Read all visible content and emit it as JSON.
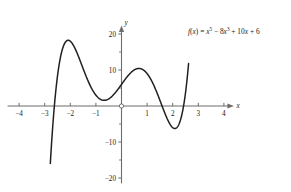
{
  "chart_data": {
    "type": "line",
    "title": "",
    "xlabel": "x",
    "ylabel": "y",
    "equation_text": "f(x) = x⁵ − 8x³ + 10x + 6",
    "equation_parts": {
      "fname": "f",
      "arg_open": "(",
      "arg": "x",
      "arg_close": ")",
      "equals": " = ",
      "term1_base": "x",
      "term1_exp": "5",
      "term2_op": " − ",
      "term2_coef": "8",
      "term2_base": "x",
      "term2_exp": "3",
      "term3_op": " + ",
      "term3_coef": "10",
      "term3_base": "x",
      "term4_op": " + ",
      "term4_const": "6"
    },
    "polynomial_coefficients": [
      6,
      10,
      0,
      -8,
      0,
      1
    ],
    "polynomial_description": "f(x) = 1*x^5 + 0*x^4 + (-8)*x^3 + 0*x^2 + 10*x + 6",
    "xlim": [
      -4.45,
      4.45
    ],
    "ylim": [
      -21.5,
      22.5
    ],
    "x_domain_drawn": [
      -2.78,
      2.62
    ],
    "grid": false,
    "legend_position": "none",
    "x_ticks_labeled": [
      -4,
      -3,
      -2,
      -1,
      1,
      2,
      3,
      4
    ],
    "x_tick_labels": [
      "−4",
      "−3",
      "−2",
      "−1",
      "1",
      "2",
      "3",
      "4"
    ],
    "y_ticks_labeled": [
      20,
      10,
      -10,
      -20
    ],
    "y_tick_labels": [
      "20",
      "10",
      "−10",
      "−20"
    ],
    "y_ticks_minor": [
      15,
      5,
      -5,
      -15
    ],
    "origin_marker": "open-circle",
    "axis_color": "#6d6d6d",
    "curve_color": "#231f20",
    "background_color": "#ffffff",
    "key_points": {
      "x_intercepts": [
        -2.72,
        1.64,
        2.43
      ],
      "local_maxima": [
        {
          "x": -2.1,
          "y": 18.0
        },
        {
          "x": 0.73,
          "y": 10.4
        }
      ],
      "local_minima": [
        {
          "x": -0.77,
          "y": 1.5
        },
        {
          "x": 2.05,
          "y": -5.5
        }
      ],
      "y_intercept": {
        "x": 0,
        "y": 6
      }
    }
  }
}
